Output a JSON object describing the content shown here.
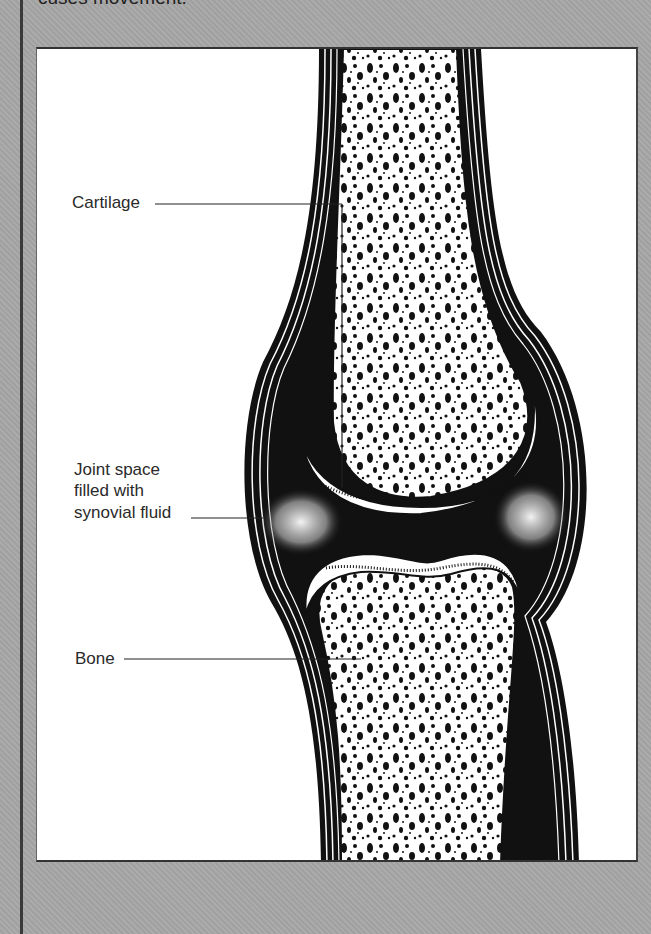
{
  "caption": {
    "text": "cuses movement."
  },
  "figure": {
    "labels": {
      "cartilage": "Cartilage",
      "joint_space_line1": "Joint space",
      "joint_space_line2": "filled with",
      "joint_space_line3": "synovial fluid",
      "bone": "Bone"
    }
  },
  "colors": {
    "panel_background": "#a7a7a7",
    "figure_background": "#ffffff",
    "ink": "#111111"
  }
}
